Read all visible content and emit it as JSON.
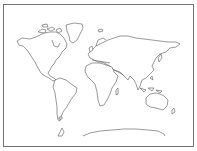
{
  "map": {
    "type": "blank world outline map",
    "background_color": "#ffffff",
    "outline_color": "#555555",
    "border_color": "#666666",
    "regions": [
      {
        "name": "North America"
      },
      {
        "name": "Greenland"
      },
      {
        "name": "South America"
      },
      {
        "name": "Europe"
      },
      {
        "name": "Asia"
      },
      {
        "name": "Africa"
      },
      {
        "name": "Australia"
      },
      {
        "name": "Antarctica"
      }
    ]
  }
}
